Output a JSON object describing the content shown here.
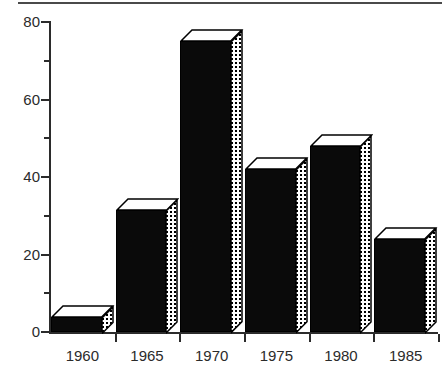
{
  "figure": {
    "top_rule": "horizontal-rule",
    "caption": "",
    "background_color": "#ffffff"
  },
  "chart_data": {
    "type": "bar",
    "title": "",
    "subtitle": "",
    "xlabel": "",
    "ylabel": "",
    "categories": [
      "1960",
      "1965",
      "1970",
      "1975",
      "1980",
      "1985"
    ],
    "values": [
      4,
      31.5,
      75,
      42,
      48,
      24
    ],
    "ylim": [
      0,
      80
    ],
    "xlim_categories": 6,
    "y_major_ticks": [
      0,
      20,
      40,
      60,
      80
    ],
    "y_major_tick_labels": [
      "0",
      "20",
      "40",
      "60",
      "80"
    ],
    "y_minor_ticks": [
      10,
      30,
      50,
      70
    ],
    "grid": false,
    "legend": null,
    "legend_position": "none",
    "style": {
      "bar_style": "3d-extruded",
      "front_face_color": "#0a0a0a",
      "top_face_color": "#ffffff",
      "side_face_pattern": "dotted-stipple",
      "side_face_color": "#ffffff",
      "outline_color": "#000000",
      "axis_color": "#2b2b2b",
      "text_color": "#2b2b2b"
    },
    "annotations": []
  }
}
